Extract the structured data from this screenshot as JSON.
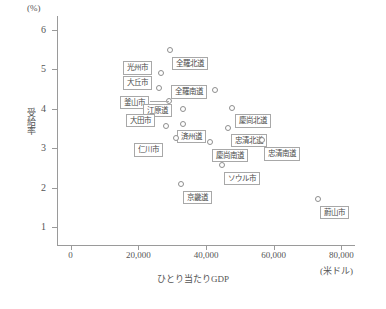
{
  "chart_data": {
    "type": "scatter",
    "title": "",
    "xlabel": "ひとり当たりGDP",
    "ylabel": "受給率",
    "x_unit": "(米ドル)",
    "y_unit": "(%)",
    "xlim": [
      -4000,
      84000
    ],
    "ylim": [
      0.55,
      6.3
    ],
    "xticks": [
      0,
      20000,
      40000,
      60000,
      80000
    ],
    "xticklabels": [
      "0",
      "20,000",
      "40,000",
      "60,000",
      "80,000"
    ],
    "yticks": [
      1,
      2,
      3,
      4,
      5,
      6
    ],
    "yticklabels": [
      "1",
      "2",
      "3",
      "4",
      "5",
      "6"
    ],
    "grid": false,
    "legend": "none",
    "marker_style": "open-circle",
    "points": [
      {
        "name": "全羅北道",
        "x": 29500,
        "y": 5.5,
        "label_dx": 2,
        "label_dy": 7,
        "leader": false
      },
      {
        "name": "光州市",
        "x": 26800,
        "y": 4.9,
        "label_dx": -38,
        "label_dy": -12,
        "leader": false
      },
      {
        "name": "大丘市",
        "x": 26200,
        "y": 4.52,
        "label_dx": -36,
        "label_dy": -12,
        "leader": false
      },
      {
        "name": "全羅南道",
        "x": 42600,
        "y": 4.47,
        "label_dx": -44,
        "label_dy": -5,
        "leader": false
      },
      {
        "name": "釜山市",
        "x": 29200,
        "y": 4.21,
        "label_dx": -49,
        "label_dy": -5,
        "leader": true
      },
      {
        "name": "江原道",
        "x": 33300,
        "y": 4.0,
        "label_dx": -40,
        "label_dy": -5,
        "leader": false
      },
      {
        "name": "慶尚北道",
        "x": 47600,
        "y": 4.02,
        "label_dx": 3,
        "label_dy": 6,
        "leader": false
      },
      {
        "name": "大田市",
        "x": 28200,
        "y": 3.57,
        "label_dx": -40,
        "label_dy": -12,
        "leader": false
      },
      {
        "name": "済州道",
        "x": 33200,
        "y": 3.62,
        "label_dx": -6,
        "label_dy": 6,
        "leader": false
      },
      {
        "name": "忠清北道",
        "x": 46600,
        "y": 3.52,
        "label_dx": 3,
        "label_dy": 6,
        "leader": false
      },
      {
        "name": "仁川市",
        "x": 31200,
        "y": 3.25,
        "label_dx": -42,
        "label_dy": 5,
        "leader": false
      },
      {
        "name": "慶尚南道",
        "x": 41200,
        "y": 3.17,
        "label_dx": 2,
        "label_dy": 7,
        "leader": false
      },
      {
        "name": "忠清南道",
        "x": 56500,
        "y": 3.2,
        "label_dx": 2,
        "label_dy": 7,
        "leader": false
      },
      {
        "name": "ソウル市",
        "x": 44600,
        "y": 2.58,
        "label_dx": 2,
        "label_dy": 7,
        "leader": false
      },
      {
        "name": "京畿道",
        "x": 32600,
        "y": 2.1,
        "label_dx": 2,
        "label_dy": 7,
        "leader": false
      },
      {
        "name": "蔚山市",
        "x": 73200,
        "y": 1.72,
        "label_dx": 2,
        "label_dy": 7,
        "leader": false
      }
    ]
  }
}
